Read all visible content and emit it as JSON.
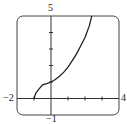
{
  "chart_data": {
    "type": "line",
    "title": "",
    "xlabel": "",
    "ylabel": "",
    "xlim": [
      -2,
      4
    ],
    "ylim": [
      -1,
      5
    ],
    "grid": false,
    "x_ticks": [
      -1,
      1,
      2,
      3
    ],
    "y_ticks": [
      1,
      2,
      3,
      4
    ],
    "window_labels": {
      "xmin": "−2",
      "xmax": "4",
      "ymin": "−1",
      "ymax": "5"
    },
    "series": [
      {
        "name": "f(x)",
        "x": [
          -1,
          -0.9,
          -0.75,
          -0.5,
          -0.25,
          0,
          0.25,
          0.5,
          0.75,
          1,
          1.25,
          1.5,
          1.75,
          2,
          2.25,
          2.4
        ],
        "y": [
          0,
          0.32,
          0.53,
          0.83,
          0.9,
          1.0,
          1.15,
          1.35,
          1.6,
          1.9,
          2.3,
          2.7,
          3.2,
          3.7,
          4.4,
          5.0
        ]
      }
    ],
    "colors": {
      "curve": "#222222",
      "axes": "#333333",
      "frame": "#444444"
    }
  }
}
